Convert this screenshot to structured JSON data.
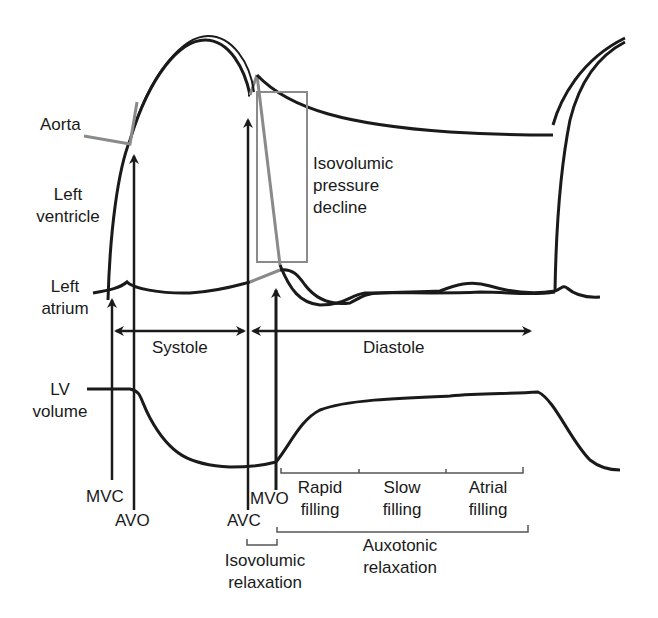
{
  "diagram": {
    "colors": {
      "primary": "#1a1a1a",
      "highlight": "#8a8a8a",
      "background": "#ffffff"
    },
    "curve_labels": {
      "aorta": "Aorta",
      "left_ventricle_1": "Left",
      "left_ventricle_2": "ventricle",
      "left_atrium_1": "Left",
      "left_atrium_2": "atrium",
      "lv_volume_1": "LV",
      "lv_volume_2": "volume"
    },
    "annotation": {
      "isovolumic_pressure_decline_1": "Isovolumic",
      "isovolumic_pressure_decline_2": "pressure",
      "isovolumic_pressure_decline_3": "decline"
    },
    "phases": {
      "systole": "Systole",
      "diastole": "Diastole"
    },
    "valve_events": {
      "mvc": "MVC",
      "avo": "AVO",
      "avc": "AVC",
      "mvo": "MVO"
    },
    "filling": {
      "rapid_1": "Rapid",
      "rapid_2": "filling",
      "slow_1": "Slow",
      "slow_2": "filling",
      "atrial_1": "Atrial",
      "atrial_2": "filling"
    },
    "relaxation": {
      "isovolumic_1": "Isovolumic",
      "isovolumic_2": "relaxation",
      "auxotonic_1": "Auxotonic",
      "auxotonic_2": "relaxation"
    }
  }
}
